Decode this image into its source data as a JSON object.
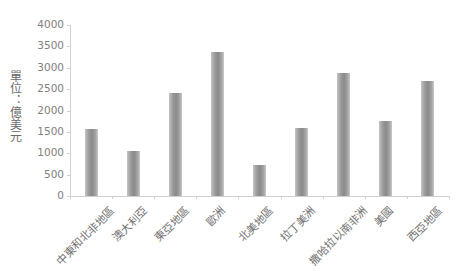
{
  "chart_data": {
    "type": "bar",
    "title": "",
    "xlabel": "",
    "ylabel": "單位：億美元",
    "ylim": [
      0,
      4000
    ],
    "yticks": [
      0,
      500,
      1000,
      1500,
      2000,
      2500,
      3000,
      3500,
      4000
    ],
    "grid": false,
    "legend": null,
    "categories": [
      "中東和北非地區",
      "澳大利亞",
      "東亞地區",
      "歐洲",
      "北美地區",
      "拉丁美洲",
      "撒哈拉以南非洲",
      "美國",
      "西亞地區"
    ],
    "values": [
      1560,
      1050,
      2400,
      3370,
      720,
      1600,
      2870,
      1750,
      2680
    ],
    "bar_color": "#8a8a8a"
  },
  "labels": {
    "ylabel": "單位：億美元",
    "yticks": [
      "0",
      "500",
      "1000",
      "1500",
      "2000",
      "2500",
      "3000",
      "3500",
      "4000"
    ],
    "categories": [
      "中東和北非地區",
      "澳大利亞",
      "東亞地區",
      "歐洲",
      "北美地區",
      "拉丁美洲",
      "撒哈拉以南非洲",
      "美國",
      "西亞地區"
    ]
  }
}
